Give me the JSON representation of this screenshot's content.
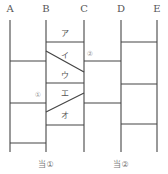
{
  "diagram": {
    "columns": [
      {
        "label": "A",
        "x": 10
      },
      {
        "label": "B",
        "x": 46
      },
      {
        "label": "C",
        "x": 84
      },
      {
        "label": "D",
        "x": 121
      },
      {
        "label": "E",
        "x": 157
      }
    ],
    "line_top": 20,
    "line_bottom": 152,
    "rungs": [
      {
        "from": "B",
        "to": "C",
        "y1": 42,
        "y2": 42
      },
      {
        "from": "B",
        "to": "C",
        "y1": 51,
        "y2": 72
      },
      {
        "from": "B",
        "to": "C",
        "y1": 83,
        "y2": 83
      },
      {
        "from": "B",
        "to": "C",
        "y1": 112,
        "y2": 93
      },
      {
        "from": "B",
        "to": "C",
        "y1": 125,
        "y2": 125
      },
      {
        "from": "A",
        "to": "B",
        "y1": 61,
        "y2": 61
      },
      {
        "from": "A",
        "to": "B",
        "y1": 103,
        "y2": 103
      },
      {
        "from": "A",
        "to": "B",
        "y1": 143,
        "y2": 143
      },
      {
        "from": "C",
        "to": "D",
        "y1": 61,
        "y2": 61
      },
      {
        "from": "C",
        "to": "D",
        "y1": 103,
        "y2": 103
      },
      {
        "from": "D",
        "to": "E",
        "y1": 42,
        "y2": 42
      },
      {
        "from": "D",
        "to": "E",
        "y1": 84,
        "y2": 84
      },
      {
        "from": "D",
        "to": "E",
        "y1": 124,
        "y2": 124
      }
    ],
    "segment_labels": [
      {
        "text": "ア",
        "x": 65,
        "y": 36
      },
      {
        "text": "イ",
        "x": 65,
        "y": 58
      },
      {
        "text": "ウ",
        "x": 65,
        "y": 78
      },
      {
        "text": "エ",
        "x": 65,
        "y": 96
      },
      {
        "text": "オ",
        "x": 65,
        "y": 118
      }
    ],
    "markers": [
      {
        "text": "①",
        "x": 38,
        "y": 97
      },
      {
        "text": "②",
        "x": 90,
        "y": 56
      }
    ],
    "results": [
      {
        "text": "当①",
        "x": 46,
        "y": 167
      },
      {
        "text": "当②",
        "x": 121,
        "y": 167
      }
    ]
  }
}
